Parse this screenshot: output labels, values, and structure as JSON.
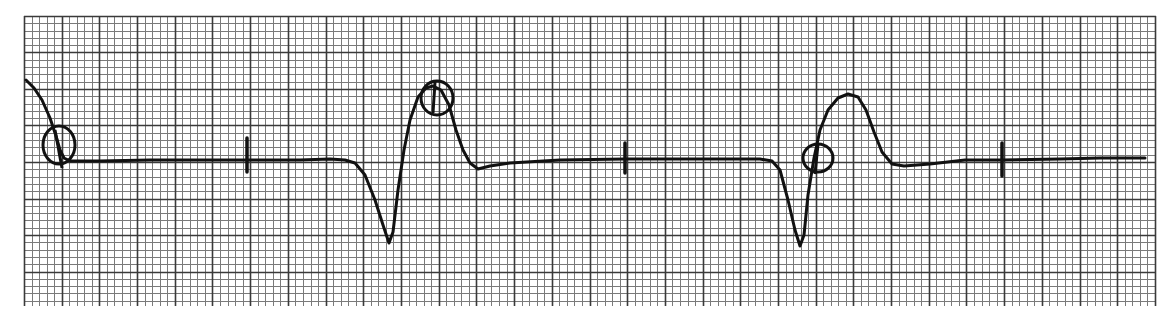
{
  "strip": {
    "type": "ecg-rhythm-strip",
    "paper": {
      "left": 24,
      "top": 16,
      "right": 1156,
      "bottom": 306,
      "minor_spacing_x": 7.54,
      "minor_spacing_y": 7.3,
      "major_every": 5,
      "minor_color": "#7a7a7a",
      "major_color": "#3a3a3a",
      "background": "#ffffff"
    },
    "trace_color": "#111111",
    "baseline_y": 160,
    "trace_points": [
      [
        26,
        80
      ],
      [
        34,
        88
      ],
      [
        42,
        100
      ],
      [
        50,
        118
      ],
      [
        56,
        136
      ],
      [
        60,
        150
      ],
      [
        64,
        158
      ],
      [
        70,
        161
      ],
      [
        100,
        161
      ],
      [
        150,
        160
      ],
      [
        200,
        160
      ],
      [
        247,
        160
      ],
      [
        300,
        160
      ],
      [
        330,
        159
      ],
      [
        345,
        160
      ],
      [
        355,
        163
      ],
      [
        365,
        175
      ],
      [
        375,
        200
      ],
      [
        383,
        225
      ],
      [
        389,
        243
      ],
      [
        393,
        232
      ],
      [
        398,
        190
      ],
      [
        404,
        150
      ],
      [
        410,
        120
      ],
      [
        418,
        97
      ],
      [
        426,
        88
      ],
      [
        433,
        86
      ],
      [
        441,
        90
      ],
      [
        449,
        105
      ],
      [
        456,
        130
      ],
      [
        463,
        150
      ],
      [
        470,
        163
      ],
      [
        478,
        169
      ],
      [
        490,
        166
      ],
      [
        510,
        163
      ],
      [
        560,
        160
      ],
      [
        625,
        159
      ],
      [
        700,
        159
      ],
      [
        760,
        159
      ],
      [
        772,
        161
      ],
      [
        780,
        170
      ],
      [
        788,
        200
      ],
      [
        795,
        230
      ],
      [
        800,
        246
      ],
      [
        804,
        235
      ],
      [
        808,
        195
      ],
      [
        814,
        158
      ],
      [
        820,
        130
      ],
      [
        828,
        110
      ],
      [
        838,
        98
      ],
      [
        848,
        94
      ],
      [
        858,
        97
      ],
      [
        866,
        110
      ],
      [
        874,
        132
      ],
      [
        882,
        152
      ],
      [
        892,
        164
      ],
      [
        904,
        166
      ],
      [
        930,
        164
      ],
      [
        965,
        160
      ],
      [
        1002,
        160
      ],
      [
        1060,
        159
      ],
      [
        1100,
        158
      ],
      [
        1145,
        158
      ]
    ],
    "ticks": [
      {
        "x": 247,
        "y_top": 138,
        "y_bottom": 172
      },
      {
        "x": 625,
        "y_top": 143,
        "y_bottom": 173
      },
      {
        "x": 1002,
        "y_top": 143,
        "y_bottom": 176
      }
    ],
    "circles": [
      {
        "cx": 59,
        "cy": 145,
        "rx": 16,
        "ry": 19,
        "label": "circle-mark-p-wave-1",
        "slash": [
          [
            55,
            130
          ],
          [
            62,
            168
          ]
        ]
      },
      {
        "cx": 437,
        "cy": 98,
        "rx": 16,
        "ry": 17,
        "label": "circle-mark-peak-1",
        "slash": [
          [
            435,
            82
          ],
          [
            433,
            113
          ]
        ]
      },
      {
        "cx": 818,
        "cy": 158,
        "rx": 15,
        "ry": 14,
        "label": "circle-mark-p-wave-2",
        "slash": [
          [
            818,
            144
          ],
          [
            815,
            174
          ]
        ]
      }
    ]
  }
}
